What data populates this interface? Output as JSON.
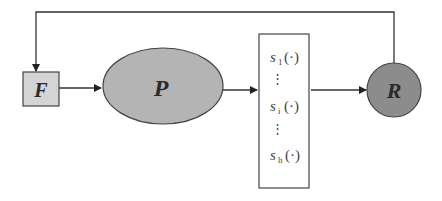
{
  "diagram": {
    "nodes": {
      "F": {
        "label": "F",
        "shape": "square",
        "fill": "#d4d4d4"
      },
      "P": {
        "label": "P",
        "shape": "ellipse",
        "fill": "#b4b4b4"
      },
      "S": {
        "shape": "rectangle",
        "fill": "#ffffff",
        "entries": [
          {
            "symbol": "s",
            "subscript": "1",
            "arg": "(·)"
          },
          {
            "ellipsis": "⋮"
          },
          {
            "symbol": "s",
            "subscript": "i",
            "arg": "(·)"
          },
          {
            "ellipsis": "⋮"
          },
          {
            "symbol": "s",
            "subscript": "h",
            "arg": "(·)"
          }
        ]
      },
      "R": {
        "label": "R",
        "shape": "circle",
        "fill": "#8c8c8c"
      }
    },
    "edges": [
      {
        "from": "F",
        "to": "P"
      },
      {
        "from": "P",
        "to": "S"
      },
      {
        "from": "S",
        "to": "R"
      },
      {
        "from": "R",
        "to": "F",
        "route": "feedback-top"
      }
    ]
  }
}
